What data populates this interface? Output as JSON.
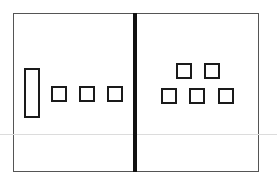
{
  "diagram": {
    "type": "base-ten-blocks",
    "colors": {
      "stroke": "#1a1a1a",
      "frame": "#555555",
      "divider": "#111111",
      "background": "#ffffff"
    },
    "left_panel": {
      "rods": [
        {
          "x": 24,
          "y": 68,
          "w": 16,
          "h": 50
        }
      ],
      "units": [
        {
          "x": 51,
          "y": 86
        },
        {
          "x": 79,
          "y": 86
        },
        {
          "x": 107,
          "y": 86
        }
      ]
    },
    "right_panel": {
      "rods": [],
      "units": [
        {
          "x": 176,
          "y": 63
        },
        {
          "x": 204,
          "y": 63
        },
        {
          "x": 161,
          "y": 88
        },
        {
          "x": 189,
          "y": 88
        },
        {
          "x": 218,
          "y": 88
        }
      ]
    }
  }
}
